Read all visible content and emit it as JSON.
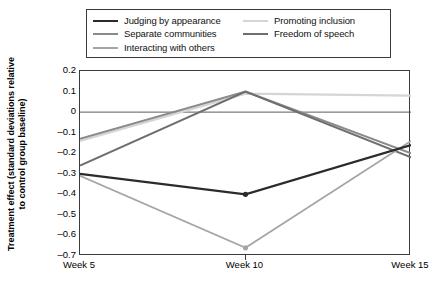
{
  "chart_data": {
    "type": "line",
    "title": "",
    "xlabel": "",
    "ylabel": "Treatment effect (standard deviations relative to control group baseline)",
    "x": [
      "Week 5",
      "Week 10",
      "Week 15"
    ],
    "categories": [
      "Week 5",
      "Week 10",
      "Week 15"
    ],
    "ylim": [
      -0.7,
      0.2
    ],
    "yticks": [
      "0.2",
      "0.1",
      "0",
      "–0.1",
      "–0.2",
      "–0.3",
      "–0.4",
      "–0.5",
      "–0.6",
      "–0.7"
    ],
    "ytick_values": [
      0.2,
      0.1,
      0,
      -0.1,
      -0.2,
      -0.3,
      -0.4,
      -0.5,
      -0.6,
      -0.7
    ],
    "grid": "zero-line-only",
    "zero_line": 0,
    "legend_position": "top-outside",
    "legend_columns": 2,
    "series": [
      {
        "name": "Judging by appearance",
        "color": "#2b2b2b",
        "width": 2.2,
        "markers": true,
        "values": [
          -0.3,
          -0.4,
          -0.16
        ]
      },
      {
        "name": "Separate communities",
        "color": "#8a8a8a",
        "width": 2.0,
        "markers": false,
        "values": [
          -0.13,
          0.1,
          -0.2
        ]
      },
      {
        "name": "Interacting with others",
        "color": "#a5a5a5",
        "width": 1.8,
        "markers": true,
        "values": [
          -0.31,
          -0.66,
          -0.14
        ]
      },
      {
        "name": "Promoting inclusion",
        "color": "#d5d5d5",
        "width": 2.2,
        "markers": false,
        "values": [
          -0.14,
          0.09,
          0.08
        ]
      },
      {
        "name": "Freedom of speech",
        "color": "#6e6e6e",
        "width": 2.0,
        "markers": false,
        "values": [
          -0.26,
          0.1,
          -0.22
        ]
      }
    ]
  },
  "legend": {
    "left_entries": [
      {
        "label": "Judging by appearance",
        "color": "#2b2b2b",
        "width": 2.4
      },
      {
        "label": "Separate communities",
        "color": "#8a8a8a",
        "width": 2.2
      },
      {
        "label": "Interacting with others",
        "color": "#a5a5a5",
        "width": 2.0
      }
    ],
    "right_entries": [
      {
        "label": "Promoting inclusion",
        "color": "#d5d5d5",
        "width": 2.4
      },
      {
        "label": "Freedom of speech",
        "color": "#6e6e6e",
        "width": 2.2
      }
    ]
  },
  "axis": {
    "y_title": "Treatment effect (standard deviations relative to control group baseline)"
  }
}
